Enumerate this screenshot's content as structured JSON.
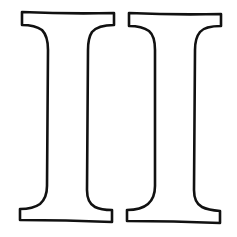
{
  "figure": {
    "text": "II",
    "letters": [
      {
        "char": "I",
        "stroke": "#111111",
        "fill": "#ffffff"
      },
      {
        "char": "I",
        "stroke": "#111111",
        "fill": "#ffffff"
      }
    ],
    "background": "#ffffff"
  }
}
